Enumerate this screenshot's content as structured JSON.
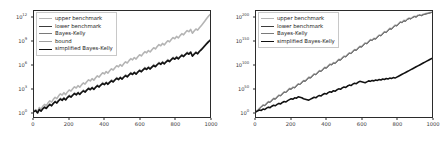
{
  "figure": {
    "background": "#ffffff",
    "panel_count": 2
  },
  "chart_data": [
    {
      "type": "line",
      "panel": "left",
      "title": "",
      "xlabel": "",
      "ylabel": "",
      "yscale": "log",
      "xlim": [
        0,
        1000
      ],
      "ylim": [
        1,
        10000000000000.0
      ],
      "grid": false,
      "legend_position": "upper left",
      "xticks": [
        0,
        200,
        400,
        600,
        800,
        1000
      ],
      "xtick_labels": [
        "0",
        "200",
        "400",
        "600",
        "800",
        "1000"
      ],
      "yticks": [
        1,
        1000,
        1000000,
        1000000000,
        1000000000000
      ],
      "ytick_labels": [
        "10^0",
        "10^3",
        "10^6",
        "10^9",
        "10^12"
      ],
      "ytick_exponents": [
        0,
        3,
        6,
        9,
        12
      ],
      "legend": [
        {
          "label": "upper benchmark",
          "color": "#b4b4b4",
          "width": 1.6
        },
        {
          "label": "lower benchmark",
          "color": "#3c3c3c",
          "width": 0.9
        },
        {
          "label": "Bayes-Kelly",
          "color": "#7a7a7a",
          "width": 0.9
        },
        {
          "label": "bound",
          "color": "#a0a0a0",
          "width": 0.9
        },
        {
          "label": "simplified Bayes-Kelly",
          "color": "#111111",
          "width": 1.6
        }
      ],
      "series": [
        {
          "name": "upper benchmark",
          "color": "#b4b4b4",
          "log10_values": [
            0.1,
            0.3,
            0.05,
            0.55,
            0.35,
            0.7,
            0.95,
            0.8,
            1.15,
            1.4,
            1.25,
            1.6,
            1.85,
            1.7,
            2.05,
            2.3,
            2.15,
            2.45,
            2.2,
            2.55,
            2.8,
            2.65,
            2.95,
            3.2,
            3.05,
            3.35,
            3.15,
            3.45,
            3.7,
            3.55,
            3.85,
            4.1,
            3.95,
            4.25,
            4.05,
            4.35,
            4.6,
            4.45,
            4.75,
            5.0,
            4.85,
            5.15,
            4.95,
            5.25,
            5.5,
            5.35,
            5.65,
            5.9,
            5.75,
            6.05,
            5.85,
            6.15,
            6.4,
            6.25,
            6.55,
            6.8,
            6.65,
            6.95,
            6.75,
            7.05,
            7.3,
            7.15,
            7.45,
            7.7,
            7.55,
            7.85,
            7.65,
            7.95,
            8.2,
            8.05,
            8.35,
            8.6,
            8.45,
            8.75,
            8.55,
            8.85,
            9.1,
            8.95,
            9.25,
            9.5,
            9.35,
            9.65,
            9.45,
            9.75,
            10.0,
            9.85,
            10.15,
            10.4,
            10.25,
            10.55,
            10.05,
            10.35,
            10.6,
            10.45,
            10.75,
            11.0,
            11.3,
            11.6,
            11.9,
            12.2,
            12.45
          ]
        },
        {
          "name": "lower benchmark",
          "color": "#3c3c3c",
          "log10_values": [
            0.05,
            0.2,
            -0.1,
            0.35,
            0.15,
            0.45,
            0.65,
            0.5,
            0.8,
            1.0,
            0.85,
            1.15,
            1.35,
            1.2,
            1.5,
            1.7,
            1.55,
            1.8,
            1.6,
            1.9,
            2.1,
            1.95,
            2.2,
            2.4,
            2.25,
            2.5,
            2.3,
            2.55,
            2.75,
            2.6,
            2.85,
            3.05,
            2.9,
            3.15,
            2.95,
            3.2,
            3.4,
            3.25,
            3.5,
            3.7,
            3.55,
            3.8,
            3.6,
            3.85,
            4.05,
            3.9,
            4.15,
            4.35,
            4.2,
            4.45,
            4.25,
            4.5,
            4.7,
            4.55,
            4.8,
            5.0,
            4.85,
            5.1,
            4.9,
            5.15,
            5.35,
            5.2,
            5.45,
            5.65,
            5.5,
            5.75,
            5.55,
            5.8,
            6.0,
            5.85,
            6.1,
            6.3,
            6.15,
            6.4,
            6.2,
            6.45,
            6.65,
            6.5,
            6.75,
            6.95,
            6.8,
            7.05,
            6.85,
            7.1,
            7.3,
            7.15,
            7.4,
            7.6,
            7.45,
            7.7,
            7.2,
            7.45,
            7.65,
            7.5,
            7.8,
            8.0,
            8.25,
            8.5,
            8.75,
            9.0,
            9.2
          ]
        },
        {
          "name": "Bayes-Kelly",
          "color": "#7a7a7a",
          "log10_values": [
            0.04,
            0.18,
            -0.12,
            0.32,
            0.12,
            0.42,
            0.62,
            0.47,
            0.76,
            0.96,
            0.81,
            1.11,
            1.31,
            1.16,
            1.46,
            1.66,
            1.51,
            1.76,
            1.56,
            1.86,
            2.06,
            1.91,
            2.16,
            2.36,
            2.21,
            2.46,
            2.26,
            2.51,
            2.71,
            2.56,
            2.81,
            3.01,
            2.86,
            3.11,
            2.91,
            3.16,
            3.36,
            3.21,
            3.46,
            3.66,
            3.51,
            3.76,
            3.56,
            3.81,
            4.01,
            3.86,
            4.11,
            4.31,
            4.16,
            4.41,
            4.21,
            4.46,
            4.66,
            4.51,
            4.76,
            4.96,
            4.81,
            5.06,
            4.86,
            5.11,
            5.31,
            5.16,
            5.41,
            5.61,
            5.46,
            5.71,
            5.51,
            5.76,
            5.96,
            5.81,
            6.06,
            6.26,
            6.11,
            6.36,
            6.16,
            6.41,
            6.61,
            6.46,
            6.71,
            6.91,
            6.76,
            7.01,
            6.81,
            7.06,
            7.26,
            7.11,
            7.36,
            7.56,
            7.41,
            7.66,
            7.16,
            7.41,
            7.61,
            7.46,
            7.76,
            7.96,
            8.21,
            8.46,
            8.71,
            8.96,
            9.16
          ]
        },
        {
          "name": "bound",
          "color": "#a0a0a0",
          "log10_values": [
            0.08,
            0.24,
            -0.04,
            0.4,
            0.2,
            0.5,
            0.7,
            0.56,
            0.86,
            1.06,
            0.92,
            1.22,
            1.42,
            1.28,
            1.58,
            1.78,
            1.62,
            1.88,
            1.68,
            1.98,
            2.18,
            2.02,
            2.28,
            2.48,
            2.32,
            2.58,
            2.38,
            2.63,
            2.83,
            2.68,
            2.93,
            3.13,
            2.98,
            3.23,
            3.03,
            3.28,
            3.48,
            3.33,
            3.58,
            3.78,
            3.63,
            3.88,
            3.68,
            3.93,
            4.13,
            3.98,
            4.23,
            4.43,
            4.28,
            4.53,
            4.33,
            4.58,
            4.78,
            4.63,
            4.88,
            5.08,
            4.93,
            5.18,
            4.98,
            5.23,
            5.43,
            5.28,
            5.53,
            5.73,
            5.58,
            5.83,
            5.63,
            5.88,
            6.08,
            5.93,
            6.18,
            6.38,
            6.23,
            6.48,
            6.28,
            6.53,
            6.73,
            6.58,
            6.83,
            7.03,
            6.88,
            7.13,
            6.93,
            7.18,
            7.38,
            7.23,
            7.48,
            7.68,
            7.53,
            7.78,
            7.28,
            7.53,
            7.73,
            7.58,
            7.88,
            8.08,
            8.33,
            8.58,
            8.83,
            9.08,
            9.28
          ]
        },
        {
          "name": "simplified Bayes-Kelly",
          "color": "#111111",
          "log10_values": [
            0.02,
            0.15,
            -0.15,
            0.28,
            0.08,
            0.38,
            0.58,
            0.43,
            0.72,
            0.92,
            0.77,
            1.07,
            1.27,
            1.12,
            1.42,
            1.62,
            1.47,
            1.72,
            1.52,
            1.82,
            2.02,
            1.87,
            2.12,
            2.32,
            2.17,
            2.42,
            2.22,
            2.47,
            2.67,
            2.52,
            2.77,
            2.97,
            2.82,
            3.07,
            2.87,
            3.12,
            3.32,
            3.17,
            3.42,
            3.62,
            3.47,
            3.72,
            3.52,
            3.77,
            3.97,
            3.82,
            4.07,
            4.27,
            4.12,
            4.37,
            4.17,
            4.42,
            4.62,
            4.47,
            4.72,
            4.92,
            4.77,
            5.02,
            4.82,
            5.07,
            5.27,
            5.12,
            5.37,
            5.57,
            5.42,
            5.67,
            5.47,
            5.72,
            5.92,
            5.77,
            6.02,
            6.22,
            6.07,
            6.32,
            6.12,
            6.37,
            6.57,
            6.42,
            6.67,
            6.87,
            6.72,
            6.97,
            6.77,
            7.02,
            7.22,
            7.07,
            7.32,
            7.52,
            7.37,
            7.62,
            7.12,
            7.37,
            7.57,
            7.42,
            7.72,
            7.92,
            8.17,
            8.42,
            8.67,
            8.92,
            9.12
          ]
        }
      ]
    },
    {
      "type": "line",
      "panel": "right",
      "title": "",
      "xlabel": "",
      "ylabel": "",
      "yscale": "log",
      "xlim": [
        0,
        1000
      ],
      "ylim": [
        1,
        1e+215
      ],
      "grid": false,
      "legend_position": "upper left",
      "xticks": [
        0,
        200,
        400,
        600,
        800,
        1000
      ],
      "xtick_labels": [
        "0",
        "200",
        "400",
        "600",
        "800",
        "1000"
      ],
      "yticks": [
        1,
        1e+50,
        1e+100,
        1e+150,
        1e+200
      ],
      "ytick_labels": [
        "10^0",
        "10^50",
        "10^100",
        "10^150",
        "10^200"
      ],
      "ytick_exponents": [
        0,
        50,
        100,
        150,
        200
      ],
      "legend": [
        {
          "label": "upper benchmark",
          "color": "#b4b4b4",
          "width": 1.6
        },
        {
          "label": "lower benchmark",
          "color": "#3c3c3c",
          "width": 0.9
        },
        {
          "label": "Bayes-Kelly",
          "color": "#7a7a7a",
          "width": 0.9
        },
        {
          "label": "simplified Bayes-Kelly",
          "color": "#111111",
          "width": 1.6
        }
      ],
      "series": [
        {
          "name": "upper benchmark",
          "color": "#b4b4b4",
          "log10_values": [
            1,
            4,
            8,
            11,
            15,
            14,
            18,
            22,
            21,
            25,
            29,
            28,
            32,
            36,
            35,
            39,
            43,
            42,
            46,
            50,
            49,
            53,
            52,
            56,
            60,
            59,
            63,
            67,
            66,
            70,
            74,
            73,
            77,
            81,
            80,
            84,
            88,
            87,
            91,
            95,
            94,
            98,
            102,
            101,
            105,
            104,
            108,
            112,
            111,
            115,
            119,
            118,
            122,
            126,
            125,
            129,
            133,
            132,
            136,
            140,
            139,
            143,
            147,
            146,
            150,
            154,
            153,
            157,
            156,
            160,
            164,
            163,
            167,
            171,
            170,
            174,
            178,
            177,
            181,
            185,
            184,
            188,
            192,
            191,
            195,
            194,
            198,
            200,
            199,
            202,
            204,
            203,
            206,
            207,
            206,
            208,
            209,
            210,
            211,
            212,
            213
          ]
        },
        {
          "name": "lower benchmark",
          "color": "#3c3c3c",
          "log10_values": [
            0,
            3,
            7,
            10,
            14,
            13,
            17,
            21,
            20,
            24,
            28,
            27,
            31,
            35,
            34,
            38,
            42,
            41,
            45,
            49,
            48,
            52,
            51,
            55,
            59,
            58,
            62,
            66,
            65,
            69,
            73,
            72,
            76,
            80,
            79,
            83,
            87,
            86,
            90,
            94,
            93,
            97,
            101,
            100,
            104,
            103,
            107,
            111,
            110,
            114,
            118,
            117,
            121,
            125,
            124,
            128,
            132,
            131,
            135,
            139,
            138,
            142,
            146,
            145,
            149,
            153,
            152,
            156,
            155,
            159,
            163,
            162,
            166,
            170,
            169,
            173,
            177,
            176,
            180,
            184,
            183,
            187,
            191,
            190,
            194,
            193,
            197,
            199,
            198,
            201,
            203,
            202,
            205,
            206,
            205,
            207,
            208,
            209,
            210,
            211,
            212
          ]
        },
        {
          "name": "Bayes-Kelly",
          "color": "#7a7a7a",
          "log10_values": [
            0,
            3,
            7,
            10,
            14,
            13,
            17,
            21,
            20,
            24,
            28,
            27,
            31,
            35,
            34,
            38,
            42,
            41,
            45,
            49,
            48,
            52,
            51,
            55,
            59,
            58,
            62,
            66,
            65,
            69,
            73,
            72,
            76,
            80,
            79,
            83,
            87,
            86,
            90,
            94,
            93,
            97,
            101,
            100,
            104,
            103,
            107,
            111,
            110,
            114,
            118,
            117,
            121,
            125,
            124,
            128,
            132,
            131,
            135,
            139,
            138,
            142,
            146,
            145,
            149,
            153,
            152,
            156,
            155,
            159,
            163,
            162,
            166,
            170,
            169,
            173,
            177,
            176,
            180,
            184,
            183,
            187,
            191,
            190,
            194,
            193,
            197,
            199,
            198,
            201,
            203,
            202,
            205,
            206,
            205,
            207,
            208,
            209,
            210,
            211,
            212
          ]
        },
        {
          "name": "simplified Bayes-Kelly",
          "color": "#111111",
          "log10_values": [
            0,
            2,
            4,
            3,
            6,
            5,
            8,
            10,
            9,
            12,
            14,
            13,
            16,
            18,
            17,
            20,
            22,
            21,
            24,
            26,
            28,
            27,
            30,
            29,
            32,
            31,
            30,
            28,
            27,
            26,
            25,
            27,
            29,
            31,
            30,
            33,
            35,
            34,
            37,
            39,
            38,
            41,
            43,
            42,
            45,
            44,
            47,
            49,
            48,
            51,
            53,
            52,
            55,
            57,
            56,
            59,
            61,
            60,
            63,
            65,
            64,
            63,
            62,
            64,
            66,
            65,
            67,
            66,
            68,
            67,
            69,
            68,
            70,
            69,
            71,
            70,
            72,
            71,
            73,
            72,
            74,
            76,
            78,
            80,
            82,
            84,
            86,
            88,
            90,
            92,
            94,
            96,
            98,
            100,
            102,
            104,
            106,
            108,
            110,
            112,
            114
          ]
        }
      ]
    }
  ]
}
